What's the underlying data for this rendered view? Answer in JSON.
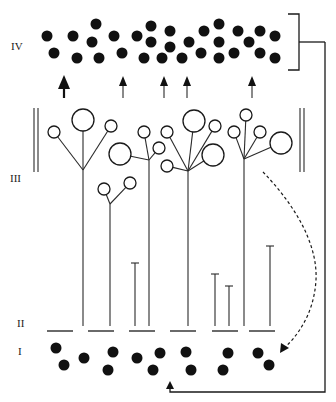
{
  "figure": {
    "type": "cortical layer schematic",
    "layer_labels": [
      {
        "text": "IV",
        "x": 11,
        "y": 50
      },
      {
        "text": "III",
        "x": 10,
        "y": 182
      },
      {
        "text": "II",
        "x": 17,
        "y": 327
      },
      {
        "text": "I",
        "x": 18,
        "y": 355
      }
    ],
    "colors": {
      "ink": "#111111",
      "background": "#ffffff"
    },
    "layer_iv_dots": [
      [
        47,
        36
      ],
      [
        54,
        53
      ],
      [
        73,
        36
      ],
      [
        77,
        58
      ],
      [
        96,
        24
      ],
      [
        92,
        42
      ],
      [
        99,
        58
      ],
      [
        114,
        36
      ],
      [
        122,
        53
      ],
      [
        137,
        36
      ],
      [
        151,
        26
      ],
      [
        151,
        42
      ],
      [
        144,
        58
      ],
      [
        170,
        31
      ],
      [
        170,
        47
      ],
      [
        162,
        58
      ],
      [
        182,
        58
      ],
      [
        189,
        42
      ],
      [
        204,
        31
      ],
      [
        201,
        53
      ],
      [
        219,
        24
      ],
      [
        219,
        42
      ],
      [
        219,
        58
      ],
      [
        234,
        53
      ],
      [
        238,
        31
      ],
      [
        249,
        42
      ],
      [
        260,
        31
      ],
      [
        260,
        53
      ],
      [
        275,
        36
      ],
      [
        275,
        58
      ]
    ],
    "layer_iv_dot_radius": 5.5,
    "bracket": {
      "x": 299,
      "top": 14,
      "bottom": 70,
      "tick_left": 288,
      "mid": 42,
      "connector_x": 325
    },
    "up_arrows": [
      {
        "x": 64,
        "bold": true
      },
      {
        "x": 123,
        "bold": false
      },
      {
        "x": 164,
        "bold": false
      },
      {
        "x": 187,
        "bold": false
      },
      {
        "x": 252,
        "bold": false
      }
    ],
    "boundary_lines": {
      "left": [
        34,
        38
      ],
      "right": [
        300,
        304
      ],
      "top": 108,
      "bottom": 172
    },
    "neurons": [
      {
        "trunk_x": 83,
        "branch_y": 170,
        "branches": [
          [
            83,
            120,
            11
          ],
          [
            54,
            132,
            6
          ],
          [
            111,
            126,
            6
          ]
        ]
      },
      {
        "trunk_x": 149,
        "branch_y": 160,
        "branches": [
          [
            120,
            154,
            11
          ],
          [
            144,
            132,
            6
          ],
          [
            159,
            148,
            6
          ]
        ]
      },
      {
        "trunk_x": 110,
        "branch_y": 204,
        "branches": [
          [
            104,
            189,
            6
          ],
          [
            130,
            183,
            6
          ]
        ]
      },
      {
        "trunk_x": 188,
        "branch_y": 171,
        "branches": [
          [
            194,
            121,
            11
          ],
          [
            167,
            132,
            6
          ],
          [
            215,
            126,
            6
          ],
          [
            167,
            166,
            6
          ],
          [
            213,
            155,
            11
          ]
        ]
      },
      {
        "trunk_x": 244,
        "branch_y": 159,
        "branches": [
          [
            246,
            115,
            6
          ],
          [
            234,
            132,
            6
          ],
          [
            260,
            132,
            6
          ],
          [
            281,
            143,
            11
          ]
        ]
      }
    ],
    "t_bars": [
      {
        "x": 135,
        "top": 263
      },
      {
        "x": 215,
        "top": 274
      },
      {
        "x": 229,
        "top": 286
      },
      {
        "x": 270,
        "top": 246
      }
    ],
    "trunk_bottom": 326,
    "layer_ii_bars": {
      "y": 331,
      "segments": [
        [
          47,
          73
        ],
        [
          88,
          114
        ],
        [
          129,
          155
        ],
        [
          170,
          196
        ],
        [
          212,
          238
        ],
        [
          249,
          275
        ]
      ]
    },
    "layer_i_dots": [
      [
        56,
        348
      ],
      [
        64,
        365
      ],
      [
        84,
        358
      ],
      [
        113,
        352
      ],
      [
        108,
        370
      ],
      [
        137,
        358
      ],
      [
        160,
        353
      ],
      [
        153,
        370
      ],
      [
        186,
        352
      ],
      [
        191,
        370
      ],
      [
        228,
        353
      ],
      [
        223,
        370
      ],
      [
        258,
        353
      ],
      [
        269,
        365
      ]
    ],
    "layer_i_dot_radius": 5.5,
    "dashed_arrow": {
      "path": "M263,172 C290,200 318,240 316,280 C314,315 296,338 282,350",
      "head": [
        280,
        353
      ]
    },
    "feedback_loop": {
      "right_x": 325,
      "top_y": 42,
      "bottom_y": 392,
      "end_x": 170,
      "arrow_head_y": 384
    }
  }
}
